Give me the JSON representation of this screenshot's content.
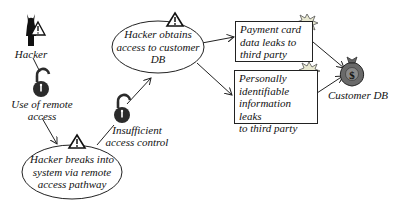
{
  "diagram": {
    "type": "attack-tree",
    "nodes": {
      "hacker": {
        "label": "Hacker",
        "icon": "hacker-devil-icon"
      },
      "remote_access": {
        "label_line1": "Use of remote",
        "label_line2": "access",
        "icon": "open-padlock-icon"
      },
      "insufficient_control": {
        "label_line1": "Insufficient",
        "label_line2": "access control",
        "icon": "open-padlock-icon"
      },
      "breaks_in": {
        "line1": "Hacker breaks into",
        "line2": "system via remote",
        "line3": "access pathway",
        "icon": "warning-triangle-icon"
      },
      "obtains_access": {
        "line1": "Hacker obtains",
        "line2": "access to customer",
        "line3": "DB",
        "icon": "warning-triangle-icon"
      },
      "payment_leak": {
        "line1": "Payment card",
        "line2": "data leaks to",
        "line3": "third party",
        "icon": "explosion-icon"
      },
      "pii_leak": {
        "line1": "Personally",
        "line2": "identifiable",
        "line3": "information leaks",
        "line4": "to third party",
        "icon": "explosion-icon"
      },
      "customer_db": {
        "label": "Customer DB",
        "icon": "money-bag-icon"
      }
    },
    "edges": [
      {
        "from": "hacker",
        "to": "remote_access"
      },
      {
        "from": "remote_access",
        "to": "breaks_in"
      },
      {
        "from": "breaks_in",
        "to": "insufficient_control"
      },
      {
        "from": "insufficient_control",
        "to": "obtains_access"
      },
      {
        "from": "obtains_access",
        "to": "payment_leak"
      },
      {
        "from": "obtains_access",
        "to": "pii_leak"
      },
      {
        "from": "payment_leak",
        "to": "customer_db"
      },
      {
        "from": "pii_leak",
        "to": "customer_db"
      }
    ],
    "colors": {
      "stroke": "#222222",
      "lock": "#2b2b2b",
      "bag": "#555555",
      "burst": "#e8e8d0"
    }
  }
}
